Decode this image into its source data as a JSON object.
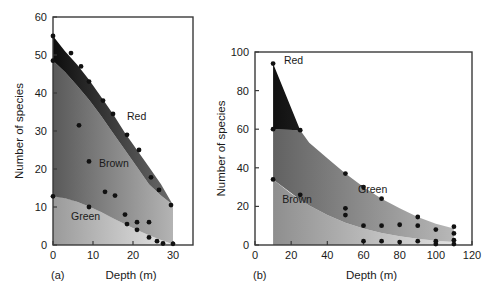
{
  "figure": {
    "background": "#ffffff",
    "ink_color": "#1a1a1a"
  },
  "chart_data": [
    {
      "id": "panel-a",
      "type": "area",
      "caption": "(a)",
      "title": "",
      "xlabel": "Depth (m)",
      "ylabel": "Number of species",
      "xlim": [
        0,
        35
      ],
      "ylim": [
        0,
        60
      ],
      "xticks": [
        0,
        10,
        20,
        30
      ],
      "xticklabels": [
        "0",
        "10",
        "20",
        "30"
      ],
      "yticks": [
        0,
        10,
        20,
        30,
        40,
        50,
        60
      ],
      "yticklabels": [
        "0",
        "10",
        "20",
        "30",
        "40",
        "50",
        "60"
      ],
      "grid": false,
      "legend_position": "in-plot annotations",
      "stack_order_bottom_to_top": [
        "Green",
        "Brown",
        "Red"
      ],
      "series": [
        {
          "name": "Green",
          "label": "Green",
          "label_xy": [
            4.5,
            6.5
          ],
          "fill_light": "#e6e6e6",
          "fill_dark": "#9a9a9a",
          "boundary_x": [
            0,
            2,
            5,
            8,
            11,
            14,
            17,
            20,
            23,
            26,
            29,
            30
          ],
          "boundary_y": [
            12.8,
            12.6,
            11.8,
            10.6,
            9.2,
            7.6,
            6.0,
            4.4,
            3.0,
            1.7,
            0.5,
            0.2
          ]
        },
        {
          "name": "Brown",
          "label": "Brown",
          "label_xy": [
            11.5,
            20.5
          ],
          "fill_light": "#b4b4b4",
          "fill_dark": "#595959",
          "boundary_x": [
            0,
            3,
            6,
            9,
            12,
            15,
            18,
            21,
            24,
            27,
            30
          ],
          "boundary_y": [
            48.5,
            45.5,
            42.0,
            38.2,
            34.0,
            29.5,
            25.0,
            20.5,
            16.0,
            13.0,
            10.5
          ]
        },
        {
          "name": "Red",
          "label": "Red",
          "label_xy": [
            18.5,
            33.0
          ],
          "fill_light": "#6b6b6b",
          "fill_dark": "#0d0d0d",
          "boundary_x": [
            0,
            3,
            6,
            9,
            12,
            15,
            18,
            21,
            24,
            27,
            30
          ],
          "boundary_y": [
            55.0,
            51.0,
            47.5,
            43.5,
            39.0,
            34.5,
            29.5,
            25.0,
            20.5,
            16.0,
            10.5
          ]
        }
      ],
      "scatter_points": [
        {
          "x": 0,
          "y": 55.0
        },
        {
          "x": 4.5,
          "y": 50.5
        },
        {
          "x": 7.0,
          "y": 47.0
        },
        {
          "x": 9.0,
          "y": 43.0
        },
        {
          "x": 12.5,
          "y": 38.0
        },
        {
          "x": 15.0,
          "y": 34.5
        },
        {
          "x": 18.5,
          "y": 29.0
        },
        {
          "x": 21.5,
          "y": 25.0
        },
        {
          "x": 24.5,
          "y": 17.8
        },
        {
          "x": 26.5,
          "y": 14.5
        },
        {
          "x": 29.5,
          "y": 10.5
        },
        {
          "x": 0,
          "y": 48.5
        },
        {
          "x": 6.5,
          "y": 31.5
        },
        {
          "x": 9.0,
          "y": 22.0
        },
        {
          "x": 13.0,
          "y": 14.0
        },
        {
          "x": 15.5,
          "y": 13.0
        },
        {
          "x": 0,
          "y": 12.8
        },
        {
          "x": 9.0,
          "y": 10.0
        },
        {
          "x": 18.0,
          "y": 8.0
        },
        {
          "x": 18.5,
          "y": 5.5
        },
        {
          "x": 21.0,
          "y": 6.0
        },
        {
          "x": 21.0,
          "y": 4.0
        },
        {
          "x": 24.0,
          "y": 6.0
        },
        {
          "x": 24.0,
          "y": 2.0
        },
        {
          "x": 26.0,
          "y": 1.0
        },
        {
          "x": 27.5,
          "y": 0.4
        },
        {
          "x": 30.0,
          "y": 0.3
        }
      ]
    },
    {
      "id": "panel-b",
      "type": "area",
      "caption": "(b)",
      "title": "",
      "xlabel": "Depth (m)",
      "ylabel": "Number of species",
      "xlim": [
        0,
        120
      ],
      "ylim": [
        0,
        100
      ],
      "xticks": [
        0,
        20,
        40,
        60,
        80,
        100,
        120
      ],
      "xticklabels": [
        "0",
        "20",
        "40",
        "60",
        "80",
        "100",
        "120"
      ],
      "yticks": [
        0,
        20,
        40,
        60,
        80,
        100
      ],
      "yticklabels": [
        "0",
        "20",
        "40",
        "60",
        "80",
        "100"
      ],
      "grid": false,
      "legend_position": "in-plot annotations",
      "stack_order_bottom_to_top": [
        "Brown",
        "Green",
        "Red"
      ],
      "series": [
        {
          "name": "Brown",
          "label": "Brown",
          "label_xy": [
            15,
            22.0
          ],
          "fill_light": "#e2e2e2",
          "fill_dark": "#8e8e8e",
          "boundary_x": [
            10,
            20,
            30,
            40,
            50,
            60,
            70,
            80,
            90,
            100,
            110
          ],
          "boundary_y": [
            34.0,
            26.5,
            20.5,
            15.5,
            11.5,
            8.5,
            6.2,
            4.5,
            3.2,
            2.2,
            1.5
          ]
        },
        {
          "name": "Green",
          "label": "Green",
          "label_xy": [
            57,
            27.0
          ],
          "fill_light": "#b8b8b8",
          "fill_dark": "#616161",
          "boundary_x": [
            10,
            25,
            30,
            40,
            50,
            60,
            70,
            80,
            90,
            100,
            110
          ],
          "boundary_y": [
            60.0,
            59.5,
            53.0,
            45.0,
            37.0,
            30.0,
            24.0,
            19.0,
            14.5,
            11.0,
            8.5
          ]
        },
        {
          "name": "Red",
          "label": "Red",
          "label_xy": [
            16,
            94.0
          ],
          "fill_light": "#5e5e5e",
          "fill_dark": "#101010",
          "boundary_x": [
            10,
            25,
            30,
            40,
            50,
            60,
            70,
            80,
            90,
            100,
            110
          ],
          "boundary_y": [
            94.0,
            59.5,
            53.0,
            45.0,
            37.0,
            30.0,
            24.0,
            19.0,
            14.5,
            11.0,
            8.5
          ]
        }
      ],
      "scatter_points": [
        {
          "x": 10,
          "y": 94.0
        },
        {
          "x": 10,
          "y": 60.0
        },
        {
          "x": 25,
          "y": 59.5
        },
        {
          "x": 10,
          "y": 34.0
        },
        {
          "x": 50,
          "y": 37.0
        },
        {
          "x": 60,
          "y": 30.0
        },
        {
          "x": 70,
          "y": 24.0
        },
        {
          "x": 90,
          "y": 14.5
        },
        {
          "x": 110,
          "y": 9.5
        },
        {
          "x": 25,
          "y": 26.0
        },
        {
          "x": 50,
          "y": 19.0
        },
        {
          "x": 50,
          "y": 15.5
        },
        {
          "x": 60,
          "y": 10.0
        },
        {
          "x": 70,
          "y": 10.0
        },
        {
          "x": 80,
          "y": 10.5
        },
        {
          "x": 90,
          "y": 10.0
        },
        {
          "x": 100,
          "y": 8.0
        },
        {
          "x": 110,
          "y": 6.0
        },
        {
          "x": 60,
          "y": 2.0
        },
        {
          "x": 70,
          "y": 2.0
        },
        {
          "x": 80,
          "y": 1.5
        },
        {
          "x": 90,
          "y": 2.0
        },
        {
          "x": 100,
          "y": 2.0
        },
        {
          "x": 100,
          "y": 0.5
        },
        {
          "x": 110,
          "y": 2.5
        },
        {
          "x": 110,
          "y": 0.5
        }
      ]
    }
  ]
}
